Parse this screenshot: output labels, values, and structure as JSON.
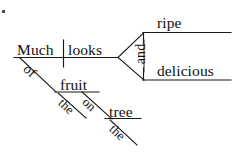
{
  "diagram": {
    "type": "reed-kellogg-sentence-diagram",
    "sentence": "Much of the fruit on the tree looks ripe and delicious.",
    "baseline_color": "#1a1a1a",
    "background_color": "#ffffff",
    "text_color": "#111111",
    "subject": {
      "label": "Much"
    },
    "verb": {
      "label": "looks"
    },
    "conjunction": {
      "label": "and"
    },
    "complements": [
      {
        "label": "ripe"
      },
      {
        "label": "delicious"
      }
    ],
    "modifiers": [
      {
        "label": "of",
        "role": "preposition",
        "attaches_to": "Much"
      },
      {
        "label": "fruit",
        "role": "object-of-preposition",
        "attaches_to": "of"
      },
      {
        "label": "the",
        "role": "article",
        "attaches_to": "fruit"
      },
      {
        "label": "on",
        "role": "preposition",
        "attaches_to": "fruit"
      },
      {
        "label": "tree",
        "role": "object-of-preposition",
        "attaches_to": "on"
      },
      {
        "label": "the",
        "role": "article",
        "attaches_to": "tree"
      }
    ]
  }
}
